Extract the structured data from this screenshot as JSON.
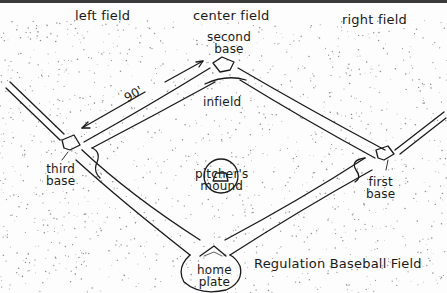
{
  "title": "Regulation Baseball Field",
  "colors": {
    "ink": "#1a1a1a",
    "paper": "#fdfdfd",
    "top_border": "#3a3a3a"
  },
  "labels": {
    "left_field": "left field",
    "center_field": "center field",
    "right_field": "right field",
    "second_base": [
      "second",
      "base"
    ],
    "third_base": [
      "third",
      "base"
    ],
    "first_base": [
      "first",
      "base"
    ],
    "infield": "infield",
    "pitchers_mound": [
      "pitcher's",
      "mound"
    ],
    "home_plate": [
      "home",
      "plate"
    ],
    "distance": "90'"
  }
}
